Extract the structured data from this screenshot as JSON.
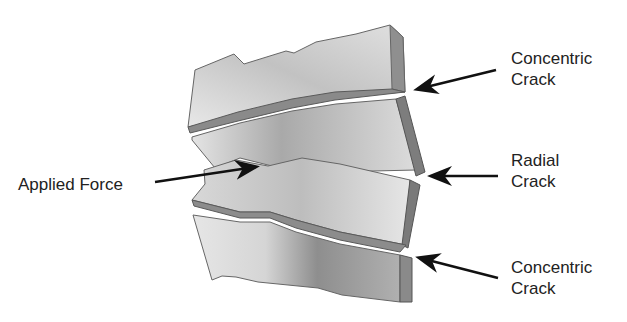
{
  "diagram": {
    "labels": {
      "applied_force": "Applied Force",
      "concentric_top_line1": "Concentric",
      "concentric_top_line2": "Crack",
      "radial_line1": "Radial",
      "radial_line2": "Crack",
      "concentric_bottom_line1": "Concentric",
      "concentric_bottom_line2": "Crack"
    },
    "colors": {
      "face_light": "#e6e6e6",
      "face_mid": "#b8b8b8",
      "face_dark": "#8a8a8a",
      "edge": "#7a7a7a",
      "outline": "#555555",
      "arrow": "#111111",
      "text": "#222222"
    }
  }
}
